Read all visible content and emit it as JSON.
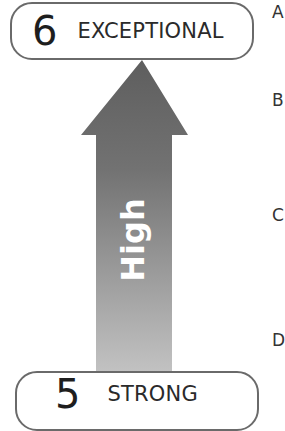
{
  "diagram": {
    "top_level": {
      "number": "6",
      "label": "EXCEPTIONAL"
    },
    "arrow": {
      "label": "High",
      "direction": "up",
      "color_top": "#5e5e5e",
      "color_bottom": "#bdbdbd"
    },
    "bottom_level": {
      "number": "5",
      "label": "STRONG"
    },
    "edge_letters": [
      "A",
      "B",
      "C",
      "D"
    ]
  }
}
